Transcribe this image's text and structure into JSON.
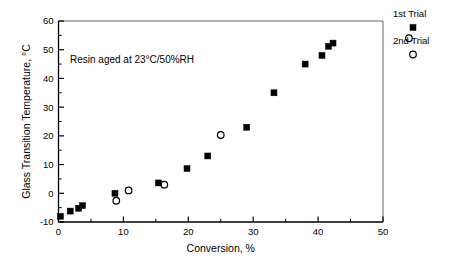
{
  "chart_data": {
    "type": "scatter",
    "title": "",
    "xlabel": "Conversion, %",
    "ylabel": "Glass Transition Temperature, °C",
    "xlim": [
      0,
      50
    ],
    "ylim": [
      -10,
      60
    ],
    "xticks": [
      0,
      10,
      20,
      30,
      40,
      50
    ],
    "yticks": [
      -10,
      0,
      10,
      20,
      30,
      40,
      50,
      60
    ],
    "xtick_labels": [
      "0",
      "10",
      "20",
      "30",
      "40",
      "50"
    ],
    "ytick_labels": [
      "-10",
      "0",
      "10",
      "20",
      "30",
      "40",
      "50",
      "60"
    ],
    "minor_ticks": true,
    "grid": false,
    "legend_position": "outside-top-right",
    "annotation": "Resin aged at 23°C/50%RH",
    "series": [
      {
        "name": "1st Trial",
        "marker": "filled-square",
        "color": "#000000",
        "points": [
          [
            0.3,
            -8.0
          ],
          [
            1.8,
            -6.2
          ],
          [
            3.1,
            -5.2
          ],
          [
            3.7,
            -4.3
          ],
          [
            8.7,
            0.0
          ],
          [
            15.4,
            3.6
          ],
          [
            19.8,
            8.6
          ],
          [
            23.0,
            13.0
          ],
          [
            29.0,
            23.0
          ],
          [
            33.2,
            35.0
          ],
          [
            38.0,
            45.0
          ],
          [
            40.6,
            48.0
          ],
          [
            41.6,
            51.2
          ],
          [
            42.3,
            52.3
          ]
        ]
      },
      {
        "name": "2nd Trial",
        "marker": "open-circle",
        "color": "#000000",
        "points": [
          [
            8.9,
            -2.6
          ],
          [
            10.8,
            1.0
          ],
          [
            16.3,
            3.0
          ],
          [
            25.0,
            20.3
          ],
          [
            54.0,
            54.0
          ]
        ]
      }
    ]
  },
  "legend": {
    "entries": [
      {
        "label": "1st Trial",
        "marker": "filled-square"
      },
      {
        "label": "2nd Trial",
        "marker": "open-circle"
      }
    ]
  },
  "axes": {
    "x_title": "Conversion, %",
    "y_title": "Glass Transition Temperature, °C"
  },
  "annotation": {
    "text": "Resin aged at 23°C/50%RH"
  }
}
